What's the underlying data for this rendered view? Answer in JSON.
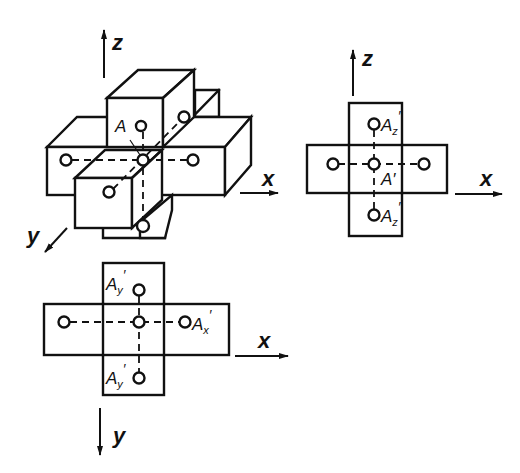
{
  "figure": {
    "colors": {
      "ink": "#111111",
      "paper": "#ffffff"
    }
  },
  "isometric_view": {
    "axes": {
      "z": "z",
      "x": "x",
      "y": "y"
    },
    "point_label": "A"
  },
  "front_view": {
    "axes": {
      "z": "z",
      "x": "x"
    },
    "labels": {
      "top_point": "A",
      "top_point_sub": "z",
      "top_point_prime": "′",
      "center_point": "A′",
      "bottom_point": "A",
      "bottom_point_sub": "z",
      "bottom_point_prime": "′"
    }
  },
  "top_view": {
    "axes": {
      "x": "x",
      "y": "y"
    },
    "labels": {
      "top_point": "A",
      "top_point_sub": "y",
      "top_point_prime": "′",
      "right_point": "A",
      "right_point_sub": "x",
      "right_point_prime": "′",
      "bottom_point": "A",
      "bottom_point_sub": "y",
      "bottom_point_prime": "′"
    }
  }
}
